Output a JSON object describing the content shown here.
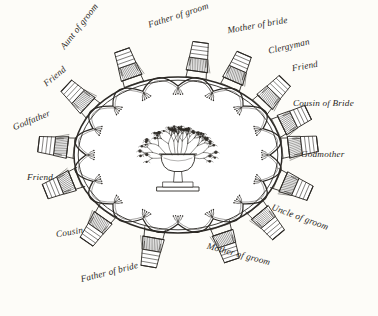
{
  "diagram": {
    "type": "circular-seating-chart",
    "table_shape": "oval",
    "centerpiece": "floral-urn",
    "seat_count": 14,
    "ink_color": "#2d2a26",
    "background_color": "#fdfcf8"
  },
  "seats": [
    {
      "label": "Aunt of groom",
      "angle": -115,
      "rotation": -52,
      "lx": 52,
      "ly": 22
    },
    {
      "label": "Father of groom",
      "angle": -80,
      "rotation": -18,
      "lx": 147,
      "ly": 11
    },
    {
      "label": "Mother of bride",
      "angle": -60,
      "rotation": -10,
      "lx": 227,
      "ly": 21
    },
    {
      "label": "Clergyman",
      "angle": -38,
      "rotation": -13,
      "lx": 268,
      "ly": 42
    },
    {
      "label": "Friend",
      "angle": -20,
      "rotation": -10,
      "lx": 292,
      "ly": 62
    },
    {
      "label": "Cousin of Bride",
      "angle": -5,
      "rotation": 0,
      "lx": 293,
      "ly": 99
    },
    {
      "label": "Godmother",
      "angle": 18,
      "rotation": 0,
      "lx": 301,
      "ly": 150
    },
    {
      "label": "Uncle of groom",
      "angle": 42,
      "rotation": 20,
      "lx": 270,
      "ly": 213
    },
    {
      "label": "Mother of groom",
      "angle": 66,
      "rotation": 15,
      "lx": 206,
      "ly": 250
    },
    {
      "label": "Father of bride",
      "angle": 103,
      "rotation": -14,
      "lx": 80,
      "ly": 268
    },
    {
      "label": "Cousin",
      "angle": 133,
      "rotation": -10,
      "lx": 56,
      "ly": 228
    },
    {
      "label": "Friend",
      "angle": 163,
      "rotation": 0,
      "lx": 27,
      "ly": 173
    },
    {
      "label": "Godfather",
      "angle": -175,
      "rotation": -22,
      "lx": 12,
      "ly": 116
    },
    {
      "label": "Friend",
      "angle": -145,
      "rotation": -40,
      "lx": 42,
      "ly": 72
    }
  ]
}
